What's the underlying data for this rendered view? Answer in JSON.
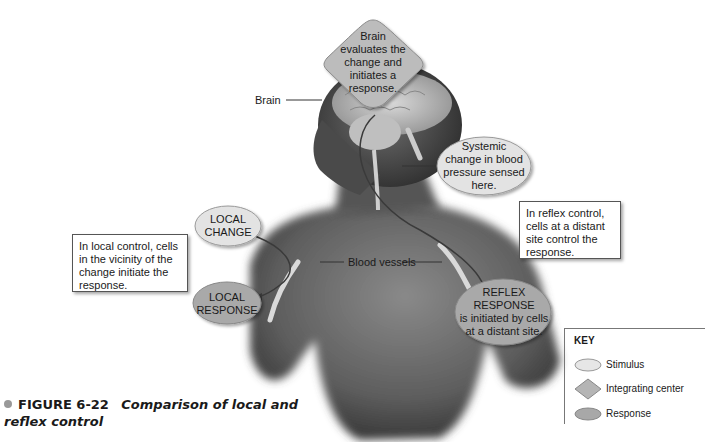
{
  "figure": {
    "number": "FIGURE 6-22",
    "title_line1": "Comparison of local and",
    "title_line2": "reflex control"
  },
  "callouts": {
    "integrating_center": {
      "lines": [
        "Brain",
        "evaluates the",
        "change and",
        "initiates a",
        "response."
      ]
    },
    "systemic_change": {
      "lines": [
        "Systemic",
        "change in blood",
        "pressure sensed",
        "here."
      ]
    },
    "local_change": {
      "lines": [
        "LOCAL",
        "CHANGE"
      ]
    },
    "local_response": {
      "lines": [
        "LOCAL",
        "RESPONSE"
      ]
    },
    "reflex_response": {
      "lines": [
        "REFLEX",
        "RESPONSE",
        "is initiated by cells",
        "at a distant site."
      ]
    }
  },
  "notes": {
    "local_control": {
      "lines": [
        "In local control, cells",
        "in the vicinity of the",
        "change initiate the",
        "response."
      ]
    },
    "reflex_control": {
      "lines": [
        "In reflex control,",
        "cells at a distant",
        "site control the",
        "response."
      ]
    }
  },
  "anatomy_labels": {
    "brain": "Brain",
    "blood_vessels": "Blood vessels"
  },
  "key": {
    "title": "KEY",
    "items": [
      {
        "shape": "ellipse",
        "label": "Stimulus",
        "color": "#e6e6e6"
      },
      {
        "shape": "diamond",
        "label": "Integrating center",
        "color": "#b5b5b5"
      },
      {
        "shape": "ellipse",
        "label": "Response",
        "color": "#a8a8a8"
      }
    ]
  },
  "colors": {
    "stimulus": "#e3e3e3",
    "integrating": "#b8b8b8",
    "response": "#a9a9a9",
    "skin_dark": "#4a4a4a",
    "skin_mid": "#777777",
    "caption_bullet": "#999999"
  }
}
